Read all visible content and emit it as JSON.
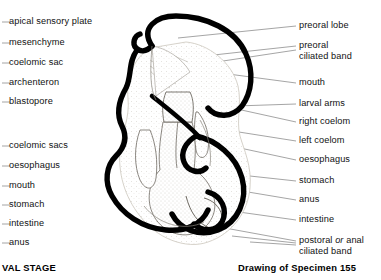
{
  "figure": {
    "title_right": "Drawing of Specimen 155",
    "title_left": "VAL STAGE"
  },
  "labels_left": [
    {
      "text": "apical sensory plate",
      "y": 22
    },
    {
      "text": "mesenchyme",
      "y": 43
    },
    {
      "text": "coelomic sac",
      "y": 63
    },
    {
      "text": "archenteron",
      "y": 83
    },
    {
      "text": "blastopore",
      "y": 102
    },
    {
      "text": "coelomic sacs",
      "y": 146
    },
    {
      "text": "oesophagus",
      "y": 166
    },
    {
      "text": "mouth",
      "y": 186
    },
    {
      "text": "stomach",
      "y": 205
    },
    {
      "text": "intestine",
      "y": 224
    },
    {
      "text": "anus",
      "y": 243
    }
  ],
  "labels_right": [
    {
      "text": "preoral lobe",
      "y": 26
    },
    {
      "text": "preoral",
      "y": 46,
      "text2": "ciliated band"
    },
    {
      "text": "mouth",
      "y": 83
    },
    {
      "text": "larval arms",
      "y": 104
    },
    {
      "text": "right coelom",
      "y": 122
    },
    {
      "text": "left coelom",
      "y": 141
    },
    {
      "text": "oesophagus",
      "y": 160
    },
    {
      "text": "stomach",
      "y": 181
    },
    {
      "text": "anus",
      "y": 200
    },
    {
      "text": "intestine",
      "y": 220
    },
    {
      "text": "postoral",
      "y": 241,
      "italic": "or",
      "text_tail": "anal",
      "text2": "ciliated band"
    }
  ],
  "colors": {
    "ink": "#000000",
    "background": "#ffffff",
    "leader": "#5a5a5a",
    "stipple": "#b9b4aa",
    "organ_outline": "#6e6a62"
  }
}
